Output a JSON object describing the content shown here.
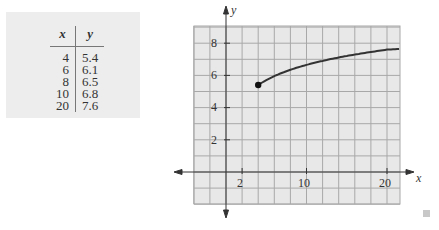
{
  "table": {
    "headers": [
      "x",
      "y"
    ],
    "rows": [
      {
        "x": "4",
        "y": "5.4"
      },
      {
        "x": "6",
        "y": "6.1"
      },
      {
        "x": "8",
        "y": "6.5"
      },
      {
        "x": "10",
        "y": "6.8"
      },
      {
        "x": "20",
        "y": "7.6"
      }
    ]
  },
  "chart_data": {
    "type": "line",
    "title": "",
    "xlabel": "x",
    "ylabel": "y",
    "x_ticks": [
      "2",
      "10",
      "20"
    ],
    "y_ticks": [
      "2",
      "4",
      "6",
      "8"
    ],
    "xlim": [
      -4,
      21.7
    ],
    "ylim": [
      -2,
      9.6
    ],
    "grid": true,
    "series": [
      {
        "name": "curve",
        "x": [
          4,
          6,
          8,
          10,
          20,
          21.7
        ],
        "y": [
          5.4,
          6.1,
          6.5,
          6.8,
          7.6,
          7.65
        ]
      }
    ],
    "start_point": {
      "x": 4,
      "y": 5.4,
      "filled": true
    },
    "colors": {
      "grid_bg": "#e8e8e8",
      "grid_line": "#a8a8a8",
      "curve": "#333333"
    }
  }
}
